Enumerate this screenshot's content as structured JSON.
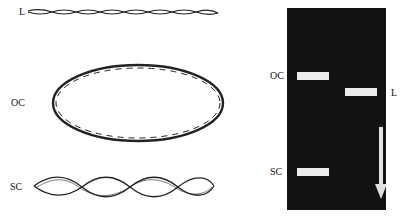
{
  "forms": {
    "linear": {
      "label": "L"
    },
    "open_circular": {
      "label": "OC"
    },
    "supercoiled": {
      "label": "SC"
    }
  },
  "gel": {
    "background_color": "#121212",
    "band_color": "#ececec",
    "lanes": [
      {
        "bands": [
          {
            "label": "OC"
          },
          {
            "label": "SC"
          }
        ]
      },
      {
        "bands": [
          {
            "label": "L"
          }
        ]
      }
    ],
    "direction": "migration arrow downward"
  }
}
